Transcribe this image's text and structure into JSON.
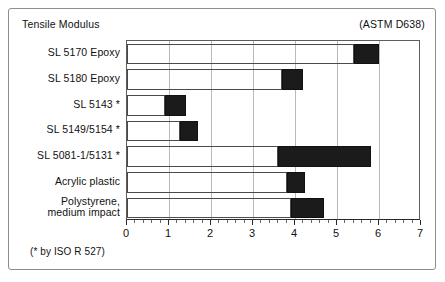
{
  "frame": {
    "title": "Tensile Modulus",
    "standard": "(ASTM D638)",
    "footnote": "(* by ISO R 527)"
  },
  "chart_data": {
    "type": "bar",
    "orientation": "horizontal",
    "title": "Tensile Modulus",
    "subtitle": "(ASTM D638)",
    "annotation": "(* by ISO R 527)",
    "xlabel": "",
    "ylabel": "",
    "xlim": [
      0,
      7
    ],
    "xticks": [
      0,
      1,
      2,
      3,
      4,
      5,
      6,
      7
    ],
    "xticklabels": [
      "0",
      "1",
      "2",
      "3",
      "4",
      "5",
      "6",
      "7"
    ],
    "minor_ticks_per_unit": 5,
    "grid": true,
    "legend": "none",
    "bar_style": "range-bar (outline from 0 to low, filled block from low to high)",
    "fill_color": "#1b1b1b",
    "outline_color": "#4a4a4a",
    "categories": [
      "SL 5170 Epoxy",
      "SL 5180 Epoxy",
      "SL 5143 *",
      "SL 5149/5154 *",
      "SL 5081-1/5131 *",
      "Acrylic plastic",
      "Polystyrene,\nmedium impact"
    ],
    "ranges": [
      {
        "label": "SL 5170 Epoxy",
        "low": 5.4,
        "high": 6.0
      },
      {
        "label": "SL 5180 Epoxy",
        "low": 3.7,
        "high": 4.2
      },
      {
        "label": "SL 5143 *",
        "low": 0.9,
        "high": 1.4
      },
      {
        "label": "SL 5149/5154 *",
        "low": 1.25,
        "high": 1.7
      },
      {
        "label": "SL 5081-1/5131 *",
        "low": 3.6,
        "high": 5.8
      },
      {
        "label": "Acrylic plastic",
        "low": 3.8,
        "high": 4.25
      },
      {
        "label": "Polystyrene, medium impact",
        "low": 3.9,
        "high": 4.7
      }
    ]
  }
}
